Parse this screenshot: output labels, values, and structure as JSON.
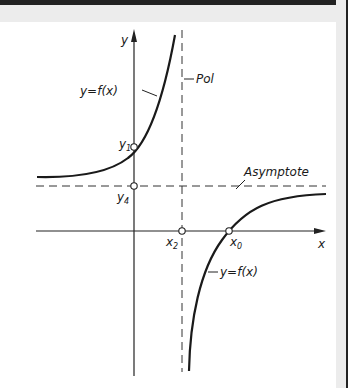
{
  "diagram": {
    "axes": {
      "x_label": "x",
      "y_label": "y"
    },
    "labels": {
      "pole": "Pol",
      "asymptote": "Asymptote",
      "function_upper": "y=f(x)",
      "function_lower": "y=f(x)"
    },
    "points": {
      "y1": {
        "base": "y",
        "sub": "1"
      },
      "y4": {
        "base": "y",
        "sub": "4"
      },
      "x2": {
        "base": "x",
        "sub": "2"
      },
      "x0": {
        "base": "x",
        "sub": "0"
      }
    },
    "colors": {
      "ink": "#1a1a1a",
      "paper": "#ffffff",
      "frame": "#222222",
      "margin": "#ececec"
    }
  }
}
